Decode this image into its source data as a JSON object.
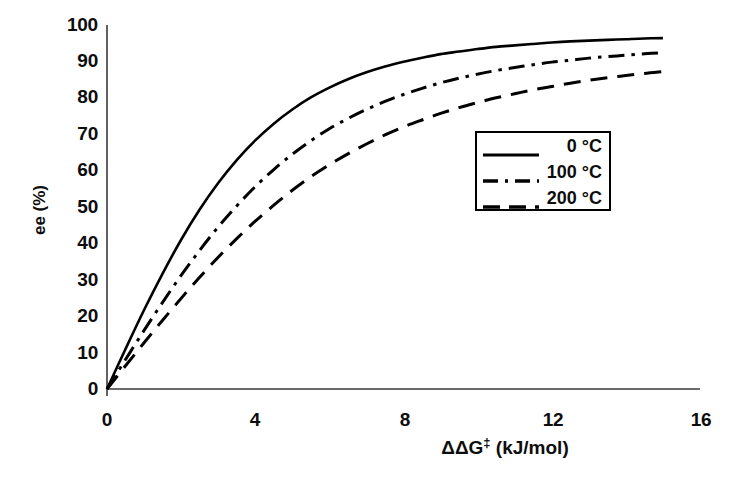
{
  "chart_data": {
    "type": "line",
    "title": "",
    "xlabel": "ΔΔG‡ (kJ/mol)",
    "ylabel": "ee (%)",
    "xlim": [
      0,
      16
    ],
    "ylim": [
      0,
      100
    ],
    "xticks": [
      0,
      4,
      8,
      12,
      16
    ],
    "xtick_labels": [
      "0",
      "4",
      "8",
      "12",
      "16"
    ],
    "yticks": [
      0,
      10,
      20,
      30,
      40,
      50,
      60,
      70,
      80,
      90,
      100
    ],
    "ytick_labels": [
      "0",
      "10",
      "20",
      "30",
      "40",
      "50",
      "60",
      "70",
      "80",
      "90",
      "100"
    ],
    "grid": false,
    "legend_position": "center-right",
    "x": [
      0,
      0.5,
      1,
      1.5,
      2,
      2.5,
      3,
      3.5,
      4,
      4.5,
      5,
      5.5,
      6,
      6.5,
      7,
      7.5,
      8,
      8.5,
      9,
      9.5,
      10,
      10.5,
      11,
      11.5,
      12,
      12.5,
      13,
      13.5,
      14,
      14.5,
      15
    ],
    "series": [
      {
        "name": "0 °C",
        "temperature_c": 0,
        "style": "solid",
        "color": "#000000",
        "values": [
          0,
          11.0,
          21.7,
          31.7,
          41.0,
          49.3,
          56.6,
          62.9,
          68.3,
          72.9,
          76.8,
          80.1,
          82.8,
          85.1,
          87.0,
          88.6,
          89.9,
          91.0,
          92.0,
          92.7,
          93.4,
          94.0,
          94.4,
          94.8,
          95.2,
          95.5,
          95.7,
          95.9,
          96.1,
          96.3,
          96.4
        ]
      },
      {
        "name": "100 °C",
        "temperature_c": 100,
        "style": "dashdot",
        "color": "#000000",
        "values": [
          0,
          8.1,
          16.1,
          23.8,
          31.2,
          38.1,
          44.5,
          50.3,
          55.6,
          60.3,
          64.5,
          68.2,
          71.5,
          74.3,
          76.8,
          79.0,
          80.9,
          82.6,
          84.1,
          85.4,
          86.5,
          87.5,
          88.3,
          89.1,
          89.8,
          90.3,
          90.9,
          91.3,
          91.7,
          92.1,
          92.4
        ]
      },
      {
        "name": "200 °C",
        "temperature_c": 200,
        "style": "dashed",
        "color": "#000000",
        "values": [
          0,
          6.4,
          12.7,
          18.9,
          24.9,
          30.7,
          36.2,
          41.3,
          46.1,
          50.5,
          54.6,
          58.3,
          61.6,
          64.6,
          67.3,
          69.8,
          72.0,
          73.9,
          75.7,
          77.3,
          78.7,
          80.0,
          81.1,
          82.2,
          83.1,
          84.0,
          84.8,
          85.5,
          86.1,
          86.7,
          87.2
        ]
      }
    ]
  },
  "axes": {
    "x_title_main": "ΔΔG",
    "x_title_sup": "‡",
    "x_title_units": " (kJ/mol)",
    "y_title": "ee (%)"
  },
  "legend": {
    "entries": [
      {
        "label": "0 °C",
        "style": "solid"
      },
      {
        "label": "100 °C",
        "style": "dashdot"
      },
      {
        "label": "200 °C",
        "style": "dashed"
      }
    ]
  },
  "colors": {
    "line": "#000000",
    "axis": "#3a3a3a",
    "text": "#0d0d0d",
    "background": "#ffffff"
  }
}
